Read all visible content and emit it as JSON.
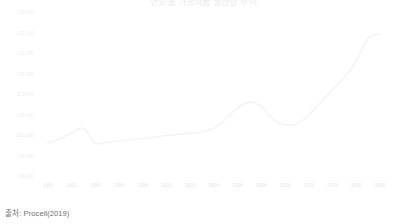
{
  "chart_data": {
    "type": "line",
    "title": "연도별 가공식품 생산량 추이",
    "xlabel": "",
    "ylabel": "",
    "grid": false,
    "legend": null,
    "xlim": [
      1989,
      2019
    ],
    "ylim": [
      95000,
      130000
    ],
    "ytick_labels": [
      "130,000",
      "125,000",
      "120,000",
      "115,000",
      "110,000",
      "105,000",
      "100,000",
      "95,000",
      "90,000"
    ],
    "ytick_values": [
      130000,
      125000,
      120000,
      115000,
      110000,
      105000,
      100000,
      95000,
      90000
    ],
    "xtick_labels": [
      "1990",
      "1992",
      "1994",
      "1996",
      "1998",
      "2000",
      "2002",
      "2004",
      "2006",
      "2008",
      "2010",
      "2012",
      "2014",
      "2016",
      "2018"
    ],
    "xtick_values": [
      1990,
      1992,
      1994,
      1996,
      1998,
      2000,
      2002,
      2004,
      2006,
      2008,
      2010,
      2012,
      2014,
      2016,
      2018
    ],
    "x": [
      1990,
      1991,
      1992,
      1993,
      1994,
      1995,
      1996,
      1997,
      1998,
      1999,
      2000,
      2001,
      2002,
      2003,
      2004,
      2005,
      2006,
      2007,
      2008,
      2009,
      2010,
      2011,
      2012,
      2013,
      2014,
      2015,
      2016,
      2017,
      2018
    ],
    "values": [
      98300,
      99300,
      100700,
      101900,
      98200,
      98500,
      98800,
      99100,
      99400,
      99700,
      100100,
      100400,
      100700,
      101000,
      101900,
      104200,
      106900,
      108300,
      107200,
      104000,
      102700,
      103000,
      105200,
      108200,
      111300,
      114300,
      118400,
      123900,
      124800
    ],
    "series": [
      {
        "name": "생산량",
        "color": "#f2f2f4",
        "values": [
          98300,
          99300,
          100700,
          101900,
          98200,
          98500,
          98800,
          99100,
          99400,
          99700,
          100100,
          100400,
          100700,
          101000,
          101900,
          104200,
          106900,
          108300,
          107200,
          104000,
          102700,
          103000,
          105200,
          108200,
          111300,
          114300,
          118400,
          123900,
          124800
        ]
      }
    ],
    "annotations": []
  },
  "source": {
    "label": "출처: Procell(2019)"
  },
  "colors": {
    "line": "#f2f2f4",
    "tick_text": "#ededf0",
    "title_text": "#e9e9ec",
    "source_text": "#6f6f73",
    "background": "#ffffff"
  }
}
